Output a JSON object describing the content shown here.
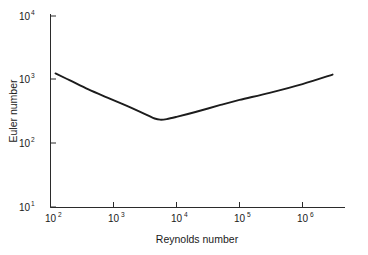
{
  "chart_data": {
    "type": "line",
    "title": "",
    "xlabel": "Reynolds number",
    "ylabel": "Euler number",
    "xscale": "log",
    "yscale": "log",
    "xlim": [
      100,
      4000000
    ],
    "ylim": [
      10,
      10000
    ],
    "grid": false,
    "legend": null,
    "xticks": [
      100,
      1000,
      10000,
      100000,
      1000000
    ],
    "xticklabels": [
      "10²",
      "10³",
      "10⁴",
      "10⁵",
      "10⁶"
    ],
    "xtick_bases": [
      "10",
      "10",
      "10",
      "10",
      "10"
    ],
    "xtick_exponents": [
      "2",
      "3",
      "4",
      "5",
      "6"
    ],
    "yticks": [
      10,
      100,
      1000,
      10000
    ],
    "yticklabels": [
      "10¹",
      "10²",
      "10³",
      "10⁴"
    ],
    "ytick_bases": [
      "10",
      "10",
      "10",
      "10"
    ],
    "ytick_exponents": [
      "1",
      "2",
      "3",
      "4"
    ],
    "series": [
      {
        "name": "Euler number",
        "color": "#1c1c1c",
        "x": [
          120,
          200,
          400,
          800,
          1500,
          2500,
          3500,
          4500,
          5500,
          7000,
          10000,
          20000,
          50000,
          100000,
          300000,
          1000000,
          3000000
        ],
        "y": [
          1250,
          980,
          700,
          520,
          400,
          320,
          275,
          245,
          235,
          240,
          260,
          310,
          400,
          480,
          620,
          850,
          1200
        ]
      }
    ],
    "annotations": [
      {
        "text": "minimum",
        "x": 5000,
        "y": 233
      }
    ]
  },
  "axes": {
    "x_title": "Reynolds number",
    "y_title": "Euler number"
  }
}
